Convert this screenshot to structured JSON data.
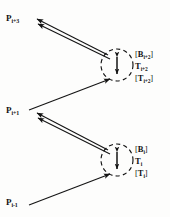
{
  "figure": {
    "background_color": "#fdfdfc",
    "ink_color": "#141414",
    "width": 170,
    "height": 217
  },
  "nodes": [
    {
      "id": "p-i-plus-3",
      "label_base": "P",
      "label_sub": "i+3",
      "x": 6,
      "y": 14
    },
    {
      "id": "p-i-plus-1",
      "label_base": "P",
      "label_sub": "i+1",
      "x": 6,
      "y": 106
    },
    {
      "id": "p-i-minus-1",
      "label_base": "P",
      "label_sub": "i-1",
      "x": 6,
      "y": 198
    }
  ],
  "surfaces": [
    {
      "id": "surface-upper",
      "center_x": 117,
      "center_y": 65,
      "radius": 16,
      "arrow_name": "vertical-double-arrow",
      "matrices": {
        "b_open": "[",
        "b_base": "B",
        "b_sub": "i+2",
        "b_close": "]",
        "t_base": "T",
        "t_sub": "i+2",
        "tb_open": "[",
        "tb_base": "T",
        "tb_sub": "i+2",
        "tb_close": "]"
      },
      "label_x": 135,
      "label_y": 50
    },
    {
      "id": "surface-lower",
      "center_x": 117,
      "center_y": 160,
      "radius": 16,
      "arrow_name": "vertical-double-arrow",
      "matrices": {
        "b_open": "[",
        "b_base": "B",
        "b_sub": "i",
        "b_close": "]",
        "t_base": "T",
        "t_sub": "i",
        "tb_open": "[",
        "tb_base": "T",
        "tb_sub": "i",
        "tb_close": "]"
      },
      "label_x": 135,
      "label_y": 145
    }
  ],
  "rays": [
    {
      "id": "ray-upper-outbound-a",
      "from": "surface-upper",
      "to": "p-i-plus-3",
      "arrowhead": "at-destination"
    },
    {
      "id": "ray-upper-outbound-b",
      "from": "surface-upper",
      "to": "p-i-plus-3",
      "arrowhead": "at-destination"
    },
    {
      "id": "ray-mid-inbound",
      "from": "p-i-plus-1",
      "to": "surface-upper",
      "arrowhead": "at-destination"
    },
    {
      "id": "ray-lower-outbound-a",
      "from": "surface-lower",
      "to": "p-i-plus-1",
      "arrowhead": "at-destination"
    },
    {
      "id": "ray-lower-outbound-b",
      "from": "surface-lower",
      "to": "p-i-plus-1",
      "arrowhead": "at-destination"
    },
    {
      "id": "ray-bottom-inbound",
      "from": "p-i-minus-1",
      "to": "surface-lower",
      "arrowhead": "at-destination"
    }
  ]
}
